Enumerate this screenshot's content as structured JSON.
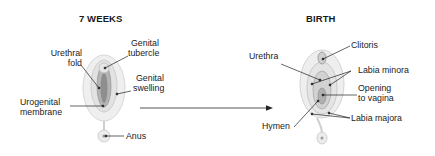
{
  "panels": [
    {
      "title": "7 WEEKS",
      "labels": {
        "urethral_fold_1": "Urethral",
        "urethral_fold_2": "fold",
        "genital_tubercle_1": "Genital",
        "genital_tubercle_2": "tubercle",
        "genital_swelling_1": "Genital",
        "genital_swelling_2": "swelling",
        "urogenital_membrane_1": "Urogenital",
        "urogenital_membrane_2": "membrane",
        "anus": "Anus"
      }
    },
    {
      "title": "BIRTH",
      "labels": {
        "clitoris": "Clitoris",
        "urethra": "Urethra",
        "labia_minora": "Labia minora",
        "opening_to_vagina_1": "Opening",
        "opening_to_vagina_2": "to vagina",
        "hymen": "Hymen",
        "labia_majora": "Labia majora"
      }
    }
  ],
  "colors": {
    "tissue_light": "#ebebeb",
    "tissue_mid": "#d4d4d4",
    "tissue_dark": "#9a9a9a",
    "leader_line": "#222222"
  }
}
